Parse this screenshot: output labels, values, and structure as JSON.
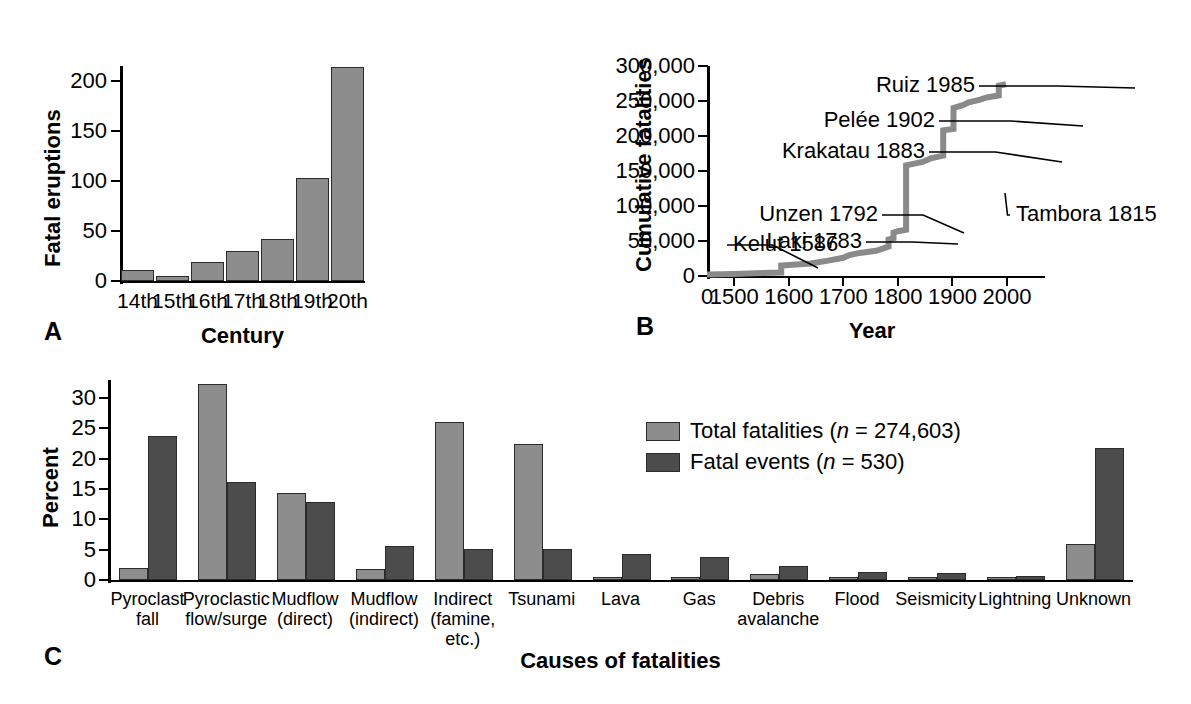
{
  "figure": {
    "panels": [
      {
        "letter": "A"
      },
      {
        "letter": "B"
      },
      {
        "letter": "C"
      }
    ]
  },
  "colors": {
    "light_gray": "#8d8d8d",
    "dark_gray": "#4c4c4c",
    "curve_gray": "#8a8a8a",
    "axis": "#000000"
  },
  "panelA": {
    "letter": "A",
    "xlabel": "Century",
    "ylabel": "Fatal eruptions",
    "yticks": [
      "0",
      "50",
      "100",
      "150",
      "200"
    ]
  },
  "panelB": {
    "letter": "B",
    "xlabel": "Year",
    "ylabel": "Cumulative fatalities",
    "yticks": [
      "0",
      "50,000",
      "100,000",
      "150,000",
      "200,000",
      "250,000",
      "300,000"
    ],
    "xticks": [
      "0",
      "1500",
      "1600",
      "1700",
      "1800",
      "1900",
      "2000"
    ],
    "annotations": [
      {
        "label": "Ruiz 1985"
      },
      {
        "label": "Pelée 1902"
      },
      {
        "label": "Krakatau 1883"
      },
      {
        "label": "Tambora 1815"
      },
      {
        "label": "Unzen 1792"
      },
      {
        "label": "Laki 1783"
      },
      {
        "label": "Kelut 1586"
      }
    ]
  },
  "panelC": {
    "letter": "C",
    "xlabel": "Causes of fatalities",
    "ylabel": "Percent",
    "yticks": [
      "0",
      "5",
      "10",
      "15",
      "20",
      "25",
      "30"
    ],
    "legend": [
      {
        "label_prefix": "Total fatalities (",
        "label_italic": "n",
        "label_suffix": " = 274,603)",
        "color": "#8d8d8d"
      },
      {
        "label_prefix": "Fatal events (",
        "label_italic": "n",
        "label_suffix": " = 530)",
        "color": "#4c4c4c"
      }
    ]
  },
  "chart_data": [
    {
      "type": "bar",
      "panel": "A",
      "title": "",
      "xlabel": "Century",
      "ylabel": "Fatal eruptions",
      "categories": [
        "14th",
        "15th",
        "16th",
        "17th",
        "18th",
        "19th",
        "20th"
      ],
      "values": [
        11,
        5,
        19,
        30,
        42,
        103,
        214
      ],
      "ylim": [
        0,
        215
      ],
      "yticks": [
        0,
        50,
        100,
        150,
        200
      ],
      "grid": false,
      "legend": "none"
    },
    {
      "type": "line",
      "panel": "B",
      "title": "",
      "xlabel": "Year",
      "ylabel": "Cumulative fatalities",
      "xlim": [
        1450,
        2000
      ],
      "ylim": [
        0,
        300000
      ],
      "yticks": [
        0,
        50000,
        100000,
        150000,
        200000,
        250000,
        300000
      ],
      "xticks": [
        1500,
        1600,
        1700,
        1800,
        1900,
        2000
      ],
      "grid": false,
      "legend": "none",
      "step": true,
      "x": [
        1450,
        1500,
        1540,
        1586,
        1586,
        1640,
        1672,
        1700,
        1711,
        1730,
        1760,
        1772,
        1783,
        1783,
        1792,
        1792,
        1800,
        1815,
        1815,
        1845,
        1860,
        1883,
        1883,
        1902,
        1902,
        1919,
        1930,
        1951,
        1963,
        1985,
        1985,
        1998
      ],
      "y": [
        2000,
        3000,
        4000,
        5000,
        15000,
        18000,
        22000,
        26000,
        30000,
        33000,
        36000,
        39000,
        42000,
        52000,
        54000,
        62000,
        64000,
        66000,
        158000,
        163000,
        168000,
        172000,
        208000,
        210000,
        240000,
        244000,
        248000,
        252000,
        255000,
        258000,
        272000,
        274000
      ],
      "annotations": [
        {
          "label": "Kelut 1586",
          "year": 1586,
          "value": 15000
        },
        {
          "label": "Laki 1783",
          "year": 1783,
          "value": 52000
        },
        {
          "label": "Unzen 1792",
          "year": 1792,
          "value": 62000
        },
        {
          "label": "Tambora 1815",
          "year": 1815,
          "value": 158000
        },
        {
          "label": "Krakatau 1883",
          "year": 1883,
          "value": 208000
        },
        {
          "label": "Pelée 1902",
          "year": 1902,
          "value": 240000
        },
        {
          "label": "Ruiz 1985",
          "year": 1985,
          "value": 272000
        }
      ]
    },
    {
      "type": "bar",
      "panel": "C",
      "title": "",
      "xlabel": "Causes of fatalities",
      "ylabel": "Percent",
      "categories": [
        "Pyroclast\nfall",
        "Pyroclastic\nflow/surge",
        "Mudflow\n(direct)",
        "Mudflow\n(indirect)",
        "Indirect\n(famine, etc.)",
        "Tsunami",
        "Lava",
        "Gas",
        "Debris\navalanche",
        "Flood",
        "Seismicity",
        "Lightning",
        "Unknown"
      ],
      "series": [
        {
          "name": "Total fatalities (n = 274,603)",
          "color": "#8d8d8d",
          "values": [
            2.0,
            32.4,
            14.3,
            1.8,
            26.0,
            22.5,
            0.2,
            0.4,
            1.0,
            0.2,
            0.1,
            0.1,
            5.9
          ]
        },
        {
          "name": "Fatal events (n = 530)",
          "color": "#4c4c4c",
          "values": [
            23.7,
            16.2,
            12.8,
            5.6,
            5.1,
            5.1,
            4.3,
            3.8,
            2.3,
            1.3,
            1.2,
            0.6,
            21.8
          ]
        }
      ],
      "ylim": [
        0,
        33
      ],
      "yticks": [
        0,
        5,
        10,
        15,
        20,
        25,
        30
      ],
      "grid": false,
      "legend": "inside-right"
    }
  ]
}
